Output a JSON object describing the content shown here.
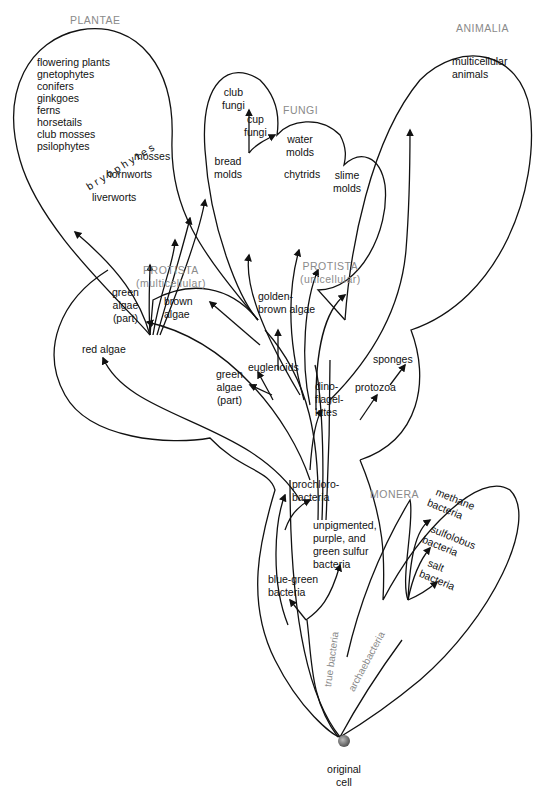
{
  "kingdoms": {
    "plantae": "PLANTAE",
    "fungi": "FUNGI",
    "animalia": "ANIMALIA",
    "protista_multi": "PROTISTA",
    "protista_multi_sub": "(multicellular)",
    "protista_uni": "PROTISTA",
    "protista_uni_sub": "(unicellular)",
    "monera": "MONERA"
  },
  "plantae": {
    "vascular": [
      "flowering plants",
      "gnetophytes",
      "conifers",
      "ginkgoes",
      "ferns",
      "horsetails",
      "club mosses",
      "psilophytes"
    ],
    "bryophytes_label": "b r y o p h y t e s",
    "mosses": "mosses",
    "hornworts": "hornworts",
    "liverworts": "liverworts"
  },
  "fungi": {
    "club_fungi": [
      "club",
      "fungi"
    ],
    "cup_fungi": [
      "cup",
      "fungi"
    ],
    "bread_molds": [
      "bread",
      "molds"
    ],
    "water_molds": [
      "water",
      "molds"
    ],
    "chytrids": "chytrids",
    "slime_molds": [
      "slime",
      "molds"
    ]
  },
  "animalia": {
    "multicellular_animals": [
      "multicellular",
      "animals"
    ],
    "sponges": "sponges",
    "protozoa": "protozoa"
  },
  "protista": {
    "green_algae_top": [
      "green",
      "algae",
      "(part)"
    ],
    "brown_algae": [
      "brown",
      "algae"
    ],
    "golden_brown_algae": [
      "golden-",
      "brown algae"
    ],
    "red_algae": "red algae",
    "green_algae_mid": [
      "green",
      "algae",
      "(part)"
    ],
    "euglenoids": "euglenoids",
    "dinoflagellates": [
      "dino-",
      "flagel-",
      "lates"
    ]
  },
  "monera": {
    "prochlorobacteria": [
      "prochloro-",
      "bacteria"
    ],
    "unpigmented": [
      "unpigmented,",
      "purple, and",
      "green sulfur",
      "bacteria"
    ],
    "blue_green": [
      "blue-green",
      "bacteria"
    ],
    "methane": [
      "methane",
      "bacteria"
    ],
    "sulfolobus": [
      "sulfolobus",
      "bacteria"
    ],
    "salt": [
      "salt",
      "bacteria"
    ],
    "true_bacteria": "true bacteria",
    "archaebacteria": "archaebacteria"
  },
  "origin": [
    "original",
    "cell"
  ]
}
